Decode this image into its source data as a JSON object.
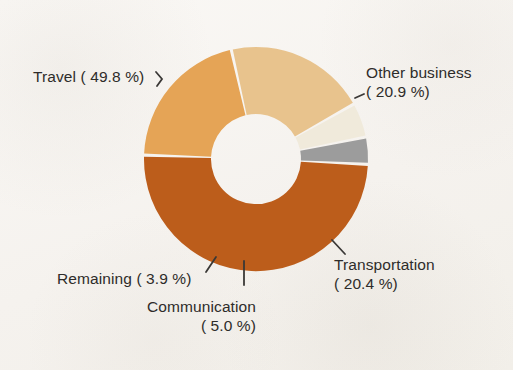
{
  "chart_data": {
    "type": "pie",
    "variant": "donut",
    "title": "",
    "subtitle": "",
    "xlabel": "",
    "ylabel": "",
    "grid": false,
    "legend_position": "none",
    "labels_position": "outside-with-leader-lines",
    "units": "percent",
    "total": 100.0,
    "categories": [
      "Travel",
      "Other business",
      "Transportation",
      "Communication",
      "Remaining"
    ],
    "values": [
      49.8,
      20.9,
      20.4,
      5.0,
      3.9
    ],
    "colors": [
      "#bc5d1b",
      "#e5a456",
      "#e8c38d",
      "#f0eadb",
      "#9c9c9c"
    ],
    "slices": [
      {
        "name": "Travel",
        "value": 49.8,
        "value_text": "49.8 %",
        "color": "#bc5d1b"
      },
      {
        "name": "Other business",
        "value": 20.9,
        "value_text": "20.9 %",
        "color": "#e5a456"
      },
      {
        "name": "Transportation",
        "value": 20.4,
        "value_text": "20.4 %",
        "color": "#e8c38d"
      },
      {
        "name": "Communication",
        "value": 5.0,
        "value_text": "5.0 %",
        "color": "#f0eadb"
      },
      {
        "name": "Remaining",
        "value": 3.9,
        "value_text": "3.9 %",
        "color": "#9c9c9c"
      }
    ]
  },
  "labels": {
    "travel": "Travel ( 49.8 %)",
    "other_business_name": "Other business",
    "other_business_value": "( 20.9 %)",
    "transportation_name": "Transportation",
    "transportation_value": "( 20.4 %)",
    "remaining": "Remaining (  3.9 %)",
    "communication_name": "Communication",
    "communication_value": "(  5.0 %)"
  },
  "style": {
    "background": "#f7f5f2",
    "text_color": "#2e2c2a",
    "leader_line_color": "#3a3836",
    "slice_gap_color": "#faf8f5"
  }
}
